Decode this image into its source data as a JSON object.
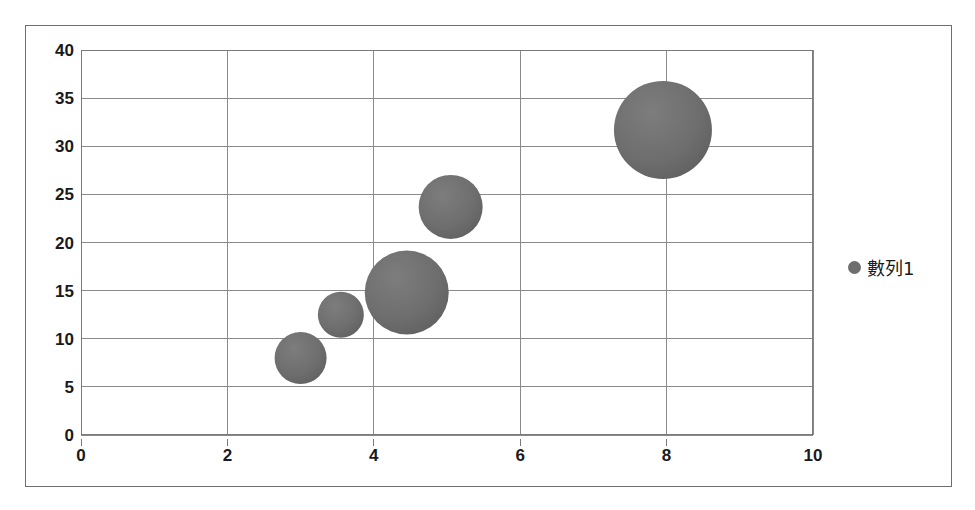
{
  "chart_data": {
    "type": "scatter",
    "subtype": "bubble",
    "title": "",
    "xlabel": "",
    "ylabel": "",
    "xlim": [
      0,
      10
    ],
    "ylim": [
      0,
      40
    ],
    "xticks": [
      0,
      2,
      4,
      6,
      8,
      10
    ],
    "yticks": [
      0,
      5,
      10,
      15,
      20,
      25,
      30,
      35,
      40
    ],
    "xtick_labels": [
      "0",
      "2",
      "4",
      "6",
      "8",
      "10"
    ],
    "ytick_labels": [
      "0",
      "5",
      "10",
      "15",
      "20",
      "25",
      "30",
      "35",
      "40"
    ],
    "grid": true,
    "grid_axes": "both",
    "legend_position": "right",
    "bubble_color": "#6e6e6e",
    "grid_color": "#8a8a8a",
    "border_color": "#6f6f6f",
    "series": [
      {
        "name": "數列1",
        "points": [
          {
            "x": 3.0,
            "y": 8.0,
            "r_px": 26,
            "size": 10
          },
          {
            "x": 3.55,
            "y": 12.5,
            "r_px": 23,
            "size": 8
          },
          {
            "x": 4.45,
            "y": 14.8,
            "r_px": 42,
            "size": 26
          },
          {
            "x": 5.05,
            "y": 23.7,
            "r_px": 32,
            "size": 15
          },
          {
            "x": 7.95,
            "y": 31.7,
            "r_px": 49,
            "size": 36
          }
        ]
      }
    ]
  },
  "legend": {
    "marker_name": "series-marker",
    "label": "數列1"
  }
}
